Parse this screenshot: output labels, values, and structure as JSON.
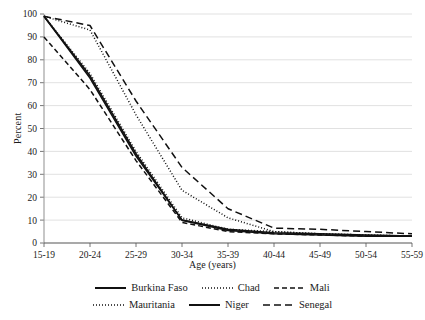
{
  "chart_data": {
    "type": "line",
    "title": "",
    "xlabel": "Age (years)",
    "ylabel": "Percent",
    "categories": [
      "15-19",
      "20-24",
      "25-29",
      "30-34",
      "35-39",
      "40-44",
      "45-49",
      "50-54",
      "55-59"
    ],
    "ylim": [
      0,
      100
    ],
    "yticks": [
      0,
      10,
      20,
      30,
      40,
      50,
      60,
      70,
      80,
      90,
      100
    ],
    "grid": "horizontal",
    "legend_position": "bottom",
    "series": [
      {
        "name": "Burkina Faso",
        "style": "solid",
        "values": [
          99,
          72,
          38,
          10,
          5.5,
          4,
          3.5,
          3,
          3
        ]
      },
      {
        "name": "Chad",
        "style": "dotted",
        "values": [
          99,
          93,
          56,
          23,
          11,
          5,
          4,
          3.5,
          3
        ]
      },
      {
        "name": "Mali",
        "style": "dashed",
        "values": [
          90,
          67,
          36,
          9,
          5,
          4,
          3.5,
          3,
          3
        ]
      },
      {
        "name": "Mauritania",
        "style": "dotted",
        "values": [
          99,
          74,
          40,
          11,
          6,
          5,
          4,
          3.5,
          3
        ]
      },
      {
        "name": "Niger",
        "style": "solid",
        "values": [
          99,
          73,
          39,
          10,
          6,
          4.5,
          4,
          3.5,
          3
        ]
      },
      {
        "name": "Senegal",
        "style": "longdash",
        "values": [
          99,
          95,
          62,
          33,
          15,
          6.5,
          6,
          5,
          4
        ]
      }
    ]
  },
  "legend": {
    "row1": [
      "Burkina Faso",
      "Chad",
      "Mali"
    ],
    "row2": [
      "Mauritania",
      "Niger",
      "Senegal"
    ]
  }
}
